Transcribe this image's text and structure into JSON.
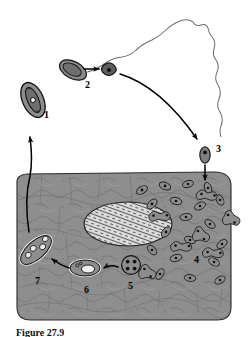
{
  "figure": {
    "caption": "Figure 27.9",
    "colors": {
      "tissue_fill": "#8c8c8c",
      "tissue_stroke": "#2b2b2b",
      "cell_fill": "#8a8a8a",
      "nucleus_fill": "#d8d8d8",
      "outline": "#000000",
      "host_outline": "#6f6f6f",
      "background": "#ffffff"
    }
  },
  "labels": [
    {
      "id": "1",
      "text": "1",
      "x": 44,
      "y": 115,
      "describes": "elongated-oocyst-cell"
    },
    {
      "id": "2",
      "text": "2",
      "x": 85,
      "y": 84,
      "describes": "released-sporozoite"
    },
    {
      "id": "3",
      "text": "3",
      "x": 216,
      "y": 148,
      "describes": "invading-cell"
    },
    {
      "id": "4",
      "text": "4",
      "x": 195,
      "y": 258,
      "describes": "dividing-parasites-in-tissue"
    },
    {
      "id": "5",
      "text": "5",
      "x": 135,
      "y": 278,
      "describes": "four-nucleate-schizont"
    },
    {
      "id": "6",
      "text": "6",
      "x": 95,
      "y": 283,
      "describes": "vacuolated-stage"
    },
    {
      "id": "7",
      "text": "7",
      "x": 40,
      "y": 277,
      "describes": "mature-multinucleate-stage"
    }
  ],
  "structures": {
    "stage1": {
      "label": "1",
      "shape": "elongated-oval-with-internal-body"
    },
    "stage2_source": {
      "label": "2",
      "shape": "elongated-oval"
    },
    "stage2_released": {
      "label": "2",
      "shape": "small-dark-teardrop-with-nucleus"
    },
    "stage3": {
      "label": "3",
      "shape": "small-elongated-cell-with-nucleus"
    },
    "stage4": {
      "label": "4",
      "shape": "many-bean-and-dumbbell-cells"
    },
    "stage5": {
      "label": "5",
      "shape": "circle-with-four-nuclei"
    },
    "stage6": {
      "label": "6",
      "shape": "ring-outlined-oval-with-inner-oval"
    },
    "stage7": {
      "label": "7",
      "shape": "ring-outlined-ellipse-with-comma-shapes"
    },
    "host_nucleus": {
      "shape": "large-hatched-oval"
    },
    "host_tissue": {
      "shape": "rounded-rectangle-block-of-cells"
    },
    "host_outline": {
      "shape": "irregular-wavy-organ-outline"
    }
  },
  "arrows": [
    {
      "name": "arrow-stage2-release",
      "from": "stage2_source",
      "to": "stage2_released"
    },
    {
      "name": "arrow-stage2-to-stage3",
      "from": "stage2_released",
      "to": "stage3"
    },
    {
      "name": "arrow-stage3-into-tissue",
      "from": "stage3",
      "to": "host_tissue"
    },
    {
      "name": "arrow-stage5-to-stage6",
      "from": "stage5",
      "to": "stage6"
    },
    {
      "name": "arrow-stage6-to-stage7",
      "from": "stage6",
      "to": "stage7"
    },
    {
      "name": "arrow-tissue-to-stage1",
      "from": "host_tissue",
      "to": "stage1"
    }
  ]
}
